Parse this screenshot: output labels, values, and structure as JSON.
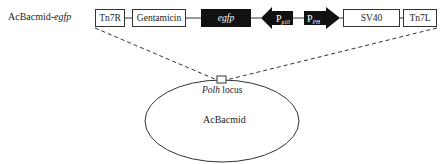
{
  "construct": {
    "name_prefix": "AcBacmid-",
    "name_italic": "egfp",
    "elements": [
      {
        "id": "tn7r",
        "label": "Tn7R",
        "style": "open"
      },
      {
        "id": "gentamicin",
        "label": "Gentamicin",
        "style": "open"
      },
      {
        "id": "egfp",
        "label": "egfp",
        "style": "filled",
        "italic": true
      },
      {
        "id": "p10",
        "label": "P",
        "subscript": "p10",
        "style": "arrow-left"
      },
      {
        "id": "ph",
        "label": "P",
        "subscript": "PH",
        "style": "arrow-right"
      },
      {
        "id": "sv40",
        "label": "SV40",
        "style": "open"
      },
      {
        "id": "tn7l",
        "label": "Tn7L",
        "style": "open"
      }
    ]
  },
  "locus": {
    "name_italic": "Polh",
    "suffix": " locus"
  },
  "genome": {
    "label": "AcBacmid"
  },
  "colors": {
    "line": "#333333",
    "filled": "#111111",
    "background": "#ffffff"
  }
}
